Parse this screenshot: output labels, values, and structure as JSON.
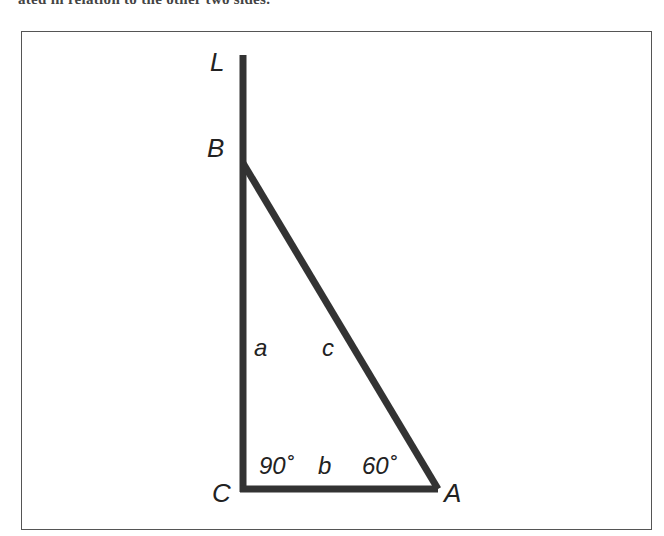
{
  "caption_fragment": "ated in relation to the other two sides.",
  "diagram": {
    "colors": {
      "stroke": "#333333",
      "text": "#222222",
      "frame": "#555555"
    },
    "points": {
      "L": {
        "label": "L",
        "x": 243,
        "y": 55
      },
      "B": {
        "label": "B",
        "x": 243,
        "y": 163
      },
      "C": {
        "label": "C",
        "x": 243,
        "y": 489
      },
      "A": {
        "label": "A",
        "x": 438,
        "y": 489
      }
    },
    "sides": {
      "a": {
        "label": "a",
        "from": "C",
        "to": "B"
      },
      "b": {
        "label": "b",
        "from": "C",
        "to": "A"
      },
      "c": {
        "label": "c",
        "from": "B",
        "to": "A"
      }
    },
    "angles": {
      "C": {
        "label": "90˚",
        "value": 90
      },
      "A": {
        "label": "60˚",
        "value": 60
      }
    }
  }
}
